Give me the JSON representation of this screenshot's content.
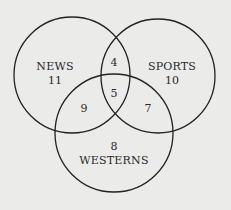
{
  "diagram": {
    "type": "venn-3",
    "colors": {
      "background": "#ebebea",
      "stroke": "#222222",
      "text": "#2a2a2a"
    },
    "sets": [
      {
        "name": "NEWS",
        "cx": 72,
        "cy": 75,
        "r": 58,
        "only_count": "11",
        "label_x": 55,
        "label_y": 70,
        "count_x": 55,
        "count_y": 84
      },
      {
        "name": "SPORTS",
        "cx": 158,
        "cy": 76,
        "r": 57,
        "only_count": "10",
        "label_x": 172,
        "label_y": 70,
        "count_x": 172,
        "count_y": 84
      },
      {
        "name": "WESTERNS",
        "cx": 114,
        "cy": 133,
        "r": 59,
        "only_count": "8",
        "label_x": 114,
        "label_y": 164,
        "count_x": 114,
        "count_y": 150
      }
    ],
    "regions": {
      "news_sports": {
        "count": "4",
        "x": 114,
        "y": 66
      },
      "news_sports_westerns": {
        "count": "5",
        "x": 114,
        "y": 97
      },
      "news_westerns": {
        "count": "9",
        "x": 84,
        "y": 112
      },
      "sports_westerns": {
        "count": "7",
        "x": 148,
        "y": 112
      }
    }
  }
}
